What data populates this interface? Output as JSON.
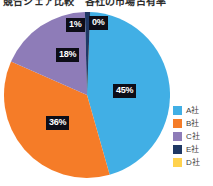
{
  "header": {
    "title_clipped": "競合シェア比較　各社の市場占有率"
  },
  "chart_data": {
    "type": "pie",
    "title": "競合シェア比較　各社の市場占有率",
    "xlabel": "",
    "ylabel": "",
    "legend_position": "right",
    "grid": false,
    "categories": [
      "A社",
      "B社",
      "C社",
      "E社",
      "D社"
    ],
    "values": [
      45,
      36,
      18,
      1,
      0
    ],
    "value_labels": [
      "45%",
      "36%",
      "18%",
      "1%",
      "0%"
    ],
    "colors": [
      "#41AFE5",
      "#F57C28",
      "#8E7CB8",
      "#1F3864",
      "#FFD24D"
    ],
    "slices": [
      {
        "name": "A社",
        "value": 45,
        "label": "45%",
        "color": "#41AFE5"
      },
      {
        "name": "B社",
        "value": 36,
        "label": "36%",
        "color": "#F57C28"
      },
      {
        "name": "C社",
        "value": 18,
        "label": "18%",
        "color": "#8E7CB8"
      },
      {
        "name": "E社",
        "value": 1,
        "label": "1%",
        "color": "#1F3864"
      },
      {
        "name": "D社",
        "value": 0,
        "label": "0%",
        "color": "#FFD24D"
      }
    ],
    "data_label_text_color": "#FFFFFF",
    "data_label_background": "#0D0D17"
  },
  "legend": {
    "items": [
      {
        "label": "A社",
        "color": "#41AFE5"
      },
      {
        "label": "B社",
        "color": "#F57C28"
      },
      {
        "label": "C社",
        "color": "#8E7CB8"
      },
      {
        "label": "E社",
        "color": "#1F3864"
      },
      {
        "label": "D社",
        "color": "#FFD24D"
      }
    ]
  }
}
